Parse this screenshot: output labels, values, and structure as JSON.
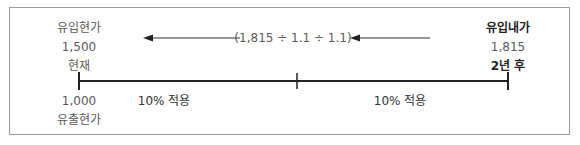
{
  "diagram": {
    "type": "present-value-timeline",
    "start": {
      "inflow_label": "유입현가",
      "inflow_value": "1,500",
      "time_label": "현재",
      "outflow_value": "1,000",
      "outflow_label": "유출현가"
    },
    "end": {
      "inflow_label": "유입내가",
      "inflow_value": "1,815",
      "time_label": "2년 후"
    },
    "discount_formula": "(1,815 ÷ 1.1 ÷ 1.1)",
    "periods": [
      {
        "label": "10% 적용"
      },
      {
        "label": "10% 적용"
      }
    ],
    "colors": {
      "line": "#222222",
      "text": "#5a5a5a",
      "border": "#9a9a9a"
    }
  }
}
